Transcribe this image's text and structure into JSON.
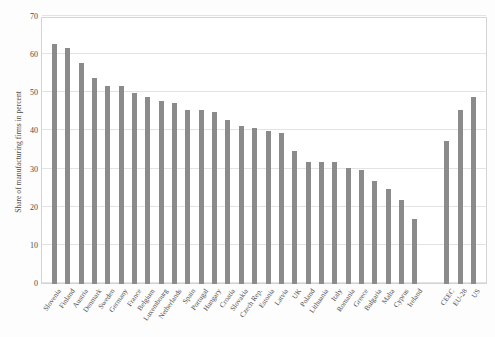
{
  "chart_data": {
    "type": "bar",
    "title": "",
    "subtitle": "",
    "xlabel": "",
    "ylabel": "Share of manufacturing firms in percent",
    "ylim": [
      0,
      70
    ],
    "yticks": [
      0,
      10,
      20,
      30,
      40,
      50,
      60,
      70
    ],
    "ytick_labels": [
      "0",
      "10",
      "20",
      "30",
      "40",
      "50",
      "60",
      "70"
    ],
    "grid": "horizontal",
    "legend": "none",
    "bar_color": "#8b8b8b",
    "categories": [
      "Slovenia",
      "Finland",
      "Austria",
      "Denmark",
      "Sweden",
      "Germany",
      "France",
      "Belgium",
      "Luxembourg",
      "Netherlands",
      "Spain",
      "Portugal",
      "Hungary",
      "Croatia",
      "Slovakia",
      "Czech Rep.",
      "Estonia",
      "Latvia",
      "UK",
      "Poland",
      "Lithuania",
      "Italy",
      "Romania",
      "Greece",
      "Bulgaria",
      "Malta",
      "Cyprus",
      "Ireland",
      "CEEC",
      "EU-28",
      "US"
    ],
    "values": [
      63,
      62,
      58,
      54,
      52,
      52,
      50,
      49,
      48,
      47.5,
      45.5,
      45.5,
      45,
      43,
      41.5,
      41,
      40,
      39.5,
      35,
      32,
      32,
      32,
      30.5,
      30,
      27,
      25,
      22,
      17,
      37.5,
      45.5,
      49
    ],
    "group_gap_after_index": 27,
    "series_name": "Share of manufacturing firms"
  },
  "figure": {
    "background": "#ffffff",
    "axis_color": "#d4d4d4",
    "grid_color": "#e3e3e3",
    "text_color": "#4a4a4a"
  }
}
